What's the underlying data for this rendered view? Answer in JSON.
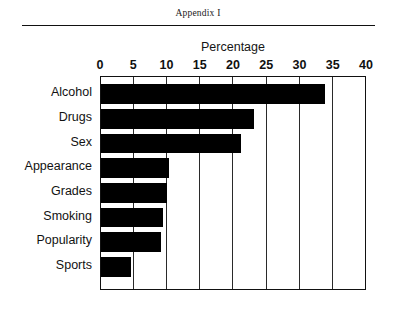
{
  "document": {
    "appendix_label": "Appendix I"
  },
  "chart_data": {
    "type": "bar",
    "orientation": "horizontal",
    "title": "Percentage",
    "xlabel": "Percentage",
    "ylabel": "",
    "categories": [
      "Alcohol",
      "Drugs",
      "Sex",
      "Appearance",
      "Grades",
      "Smoking",
      "Popularity",
      "Sports"
    ],
    "values": [
      33.7,
      23.0,
      21.0,
      10.2,
      9.9,
      9.3,
      9.0,
      4.5
    ],
    "xlim": [
      0,
      40
    ],
    "xticks": [
      0,
      5,
      10,
      15,
      20,
      25,
      30,
      35,
      40
    ],
    "xtick_labels": [
      "0",
      "5",
      "10",
      "15",
      "20",
      "25",
      "30",
      "35",
      "40"
    ],
    "grid": true,
    "grid_axis": "x",
    "legend": false,
    "bar_color": "#000000",
    "frame_color": "#111111",
    "background": "#ffffff"
  }
}
